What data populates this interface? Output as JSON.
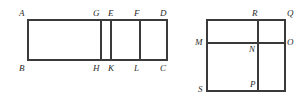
{
  "page": {
    "background_color": "#ffffff",
    "stroke_color": "#3a3a3a",
    "label_color": "#2b2b2b",
    "width": 304,
    "height": 99
  },
  "figures": [
    {
      "id": "figure-left",
      "name": "rectangle-abcd-with-vertical-divisions",
      "shape": "rectangle",
      "bounds": {
        "x1": 28,
        "y1": 20,
        "x2": 167,
        "y2": 60
      },
      "internal_vertical_lines": [
        {
          "name": "segment-gh",
          "x": 101
        },
        {
          "name": "segment-ek",
          "x": 111
        },
        {
          "name": "segment-fl",
          "x": 140
        }
      ],
      "labels": [
        {
          "id": "label-a",
          "text": "A",
          "x": 19,
          "y": 9,
          "anchor": "top-left-outside"
        },
        {
          "id": "label-g",
          "text": "G",
          "x": 93,
          "y": 9,
          "anchor": "top"
        },
        {
          "id": "label-e",
          "text": "E",
          "x": 108,
          "y": 9,
          "anchor": "top"
        },
        {
          "id": "label-f",
          "text": "F",
          "x": 134,
          "y": 9,
          "anchor": "top"
        },
        {
          "id": "label-d",
          "text": "D",
          "x": 160,
          "y": 9,
          "anchor": "top-right"
        },
        {
          "id": "label-b",
          "text": "B",
          "x": 19,
          "y": 64,
          "anchor": "bottom-left-outside"
        },
        {
          "id": "label-h",
          "text": "H",
          "x": 93,
          "y": 64,
          "anchor": "bottom"
        },
        {
          "id": "label-k",
          "text": "K",
          "x": 108,
          "y": 64,
          "anchor": "bottom"
        },
        {
          "id": "label-l",
          "text": "L",
          "x": 134,
          "y": 64,
          "anchor": "bottom"
        },
        {
          "id": "label-c",
          "text": "C",
          "x": 160,
          "y": 64,
          "anchor": "bottom-right"
        }
      ]
    },
    {
      "id": "figure-right",
      "name": "square-with-midlines",
      "shape": "square",
      "bounds": {
        "x1": 207,
        "y1": 20,
        "x2": 285,
        "y2": 91
      },
      "internal_horizontal_lines": [
        {
          "name": "segment-mo",
          "y": 43
        }
      ],
      "internal_vertical_lines": [
        {
          "name": "segment-rp",
          "x": 258
        }
      ],
      "labels": [
        {
          "id": "label-r",
          "text": "R",
          "x": 252,
          "y": 9,
          "anchor": "top"
        },
        {
          "id": "label-q",
          "text": "Q",
          "x": 287,
          "y": 9,
          "anchor": "top-right-outside"
        },
        {
          "id": "label-m",
          "text": "M",
          "x": 195,
          "y": 38,
          "anchor": "left-outside"
        },
        {
          "id": "label-n",
          "text": "N",
          "x": 249,
          "y": 45,
          "anchor": "interior"
        },
        {
          "id": "label-o",
          "text": "O",
          "x": 287,
          "y": 38,
          "anchor": "right-outside"
        },
        {
          "id": "label-s",
          "text": "S",
          "x": 198,
          "y": 85,
          "anchor": "bottom-left-outside"
        },
        {
          "id": "label-p",
          "text": "P",
          "x": 250,
          "y": 80,
          "anchor": "bottom"
        }
      ]
    }
  ]
}
